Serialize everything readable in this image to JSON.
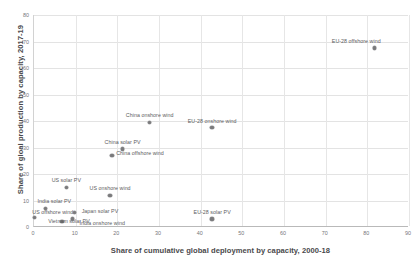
{
  "chart_data": {
    "type": "scatter",
    "title": "",
    "xlabel": "Share of cumulative global deployment by capacity, 2000-18",
    "ylabel": "Share of gloal production by capacity, 2017-19",
    "xlim": [
      0,
      90
    ],
    "ylim": [
      0,
      80
    ],
    "xticks": [
      0,
      10,
      20,
      30,
      40,
      50,
      60,
      70,
      80,
      90
    ],
    "yticks": [
      0,
      10,
      20,
      30,
      40,
      50,
      60,
      70,
      80
    ],
    "grid": true,
    "legend": "none",
    "points": [
      {
        "label": "EU-28 offshore wind",
        "x": 82.0,
        "y": 67.5,
        "anchor": "end",
        "dx": 6,
        "dy": -7
      },
      {
        "label": "China onshore wind",
        "x": 28.0,
        "y": 39.5,
        "anchor": "mid",
        "dx": 0,
        "dy": -7
      },
      {
        "label": "EU-28 onshore wind",
        "x": 43.0,
        "y": 37.5,
        "anchor": "mid",
        "dx": 0,
        "dy": -7
      },
      {
        "label": "China solar PV",
        "x": 21.5,
        "y": 29.5,
        "anchor": "mid",
        "dx": 0,
        "dy": -7
      },
      {
        "label": "China offshore wind",
        "x": 19.0,
        "y": 27.0,
        "anchor": "start",
        "dx": 4,
        "dy": -2
      },
      {
        "label": "US solar PV",
        "x": 8.0,
        "y": 15.0,
        "anchor": "mid",
        "dx": 0,
        "dy": -7
      },
      {
        "label": "US onshore wind",
        "x": 18.5,
        "y": 12.0,
        "anchor": "mid",
        "dx": 0,
        "dy": -7
      },
      {
        "label": "India solar PV",
        "x": 3.0,
        "y": 7.0,
        "anchor": "start",
        "dx": -8,
        "dy": -7
      },
      {
        "label": "US offshore wind",
        "x": 0.3,
        "y": 3.5,
        "anchor": "start",
        "dx": -2,
        "dy": -6
      },
      {
        "label": "Vietnam solar PV",
        "x": 7.0,
        "y": 2.0,
        "anchor": "start",
        "dx": -14,
        "dy": -1
      },
      {
        "label": "Japan solar PV",
        "x": 10.0,
        "y": 5.5,
        "anchor": "start",
        "dx": 7,
        "dy": -1
      },
      {
        "label": "India onshore wind",
        "x": 9.5,
        "y": 3.0,
        "anchor": "start",
        "dx": 7,
        "dy": 4
      },
      {
        "label": "EU-28 solar PV",
        "x": 43.0,
        "y": 3.0,
        "anchor": "mid",
        "dx": 0,
        "dy": -7
      }
    ]
  },
  "colors": {
    "marker": "#7a7a7c",
    "grid": "#e3e3e3",
    "axis": "#b9b9b9",
    "text": "#59595b"
  }
}
